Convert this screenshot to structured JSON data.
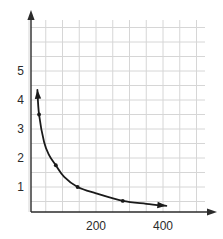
{
  "chart_data": {
    "type": "line",
    "title": "",
    "xlabel": "",
    "ylabel": "",
    "xlim": [
      0,
      460
    ],
    "ylim": [
      0,
      6.2
    ],
    "grid": true,
    "grid_color": "#d6d6d6",
    "grid_x_step": 50,
    "grid_y_step": 0.5,
    "axis_color": "#2b2b2b",
    "curve_color": "#1a1a1a",
    "marker_color": "#1a1a1a",
    "legend": "none",
    "x_ticks": [
      {
        "value": 200,
        "label": "200"
      },
      {
        "value": 400,
        "label": "400"
      }
    ],
    "y_ticks": [
      {
        "value": 1,
        "label": "1"
      },
      {
        "value": 2,
        "label": "2"
      },
      {
        "value": 3,
        "label": "3"
      },
      {
        "value": 4,
        "label": "4"
      },
      {
        "value": 5,
        "label": "5"
      }
    ],
    "series": [
      {
        "name": "inverse-curve",
        "x": [
          30,
          80,
          145,
          280
        ],
        "y": [
          3.5,
          1.75,
          1.0,
          0.52
        ],
        "markers": true,
        "arrow_start": {
          "x": 25,
          "y": 4.35
        },
        "arrow_end": {
          "x": 410,
          "y": 0.35
        },
        "curve_points": [
          {
            "x": 25,
            "y": 4.35
          },
          {
            "x": 30,
            "y": 3.5
          },
          {
            "x": 45,
            "y": 2.55
          },
          {
            "x": 60,
            "y": 2.1
          },
          {
            "x": 80,
            "y": 1.75
          },
          {
            "x": 105,
            "y": 1.35
          },
          {
            "x": 145,
            "y": 1.0
          },
          {
            "x": 200,
            "y": 0.78
          },
          {
            "x": 280,
            "y": 0.52
          },
          {
            "x": 350,
            "y": 0.42
          },
          {
            "x": 410,
            "y": 0.35
          }
        ]
      }
    ]
  }
}
